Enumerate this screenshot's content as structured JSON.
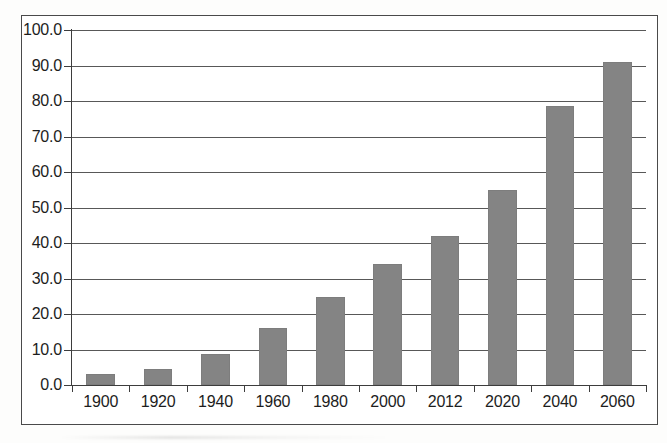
{
  "chart_data": {
    "type": "bar",
    "title": "",
    "subtitle": "",
    "xlabel": "",
    "ylabel": "",
    "categories": [
      "1900",
      "1920",
      "1940",
      "1960",
      "1980",
      "2000",
      "2012",
      "2020",
      "2040",
      "2060"
    ],
    "values": [
      3.0,
      4.5,
      8.7,
      16.0,
      24.8,
      34.0,
      42.0,
      55.0,
      78.5,
      91.0
    ],
    "ylim": [
      0.0,
      100.0
    ],
    "ytick_values": [
      0.0,
      10.0,
      20.0,
      30.0,
      40.0,
      50.0,
      60.0,
      70.0,
      80.0,
      90.0,
      100.0
    ],
    "ytick_labels": [
      "0.0",
      "10.0",
      "20.0",
      "30.0",
      "40.0",
      "50.0",
      "60.0",
      "70.0",
      "80.0",
      "90.0",
      "100.0"
    ],
    "grid": true,
    "grid_axis": "y",
    "legend": false,
    "legend_position": "none",
    "bar_color": "#848484",
    "axis_color": "#3d3d3d",
    "background_color": "#ffffff",
    "series": [
      {
        "name": "",
        "values": [
          3.0,
          4.5,
          8.7,
          16.0,
          24.8,
          34.0,
          42.0,
          55.0,
          78.5,
          91.0
        ]
      }
    ]
  }
}
